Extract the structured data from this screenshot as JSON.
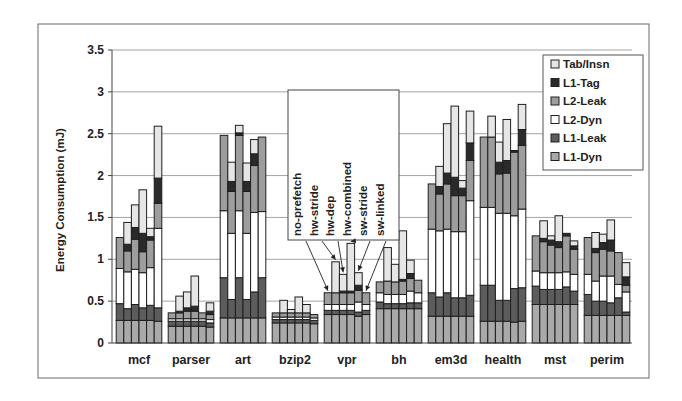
{
  "chart_data": {
    "type": "bar",
    "subtype": "grouped-stacked",
    "title": "",
    "xlabel": "",
    "ylabel": "Energy Consumption  (mJ)",
    "ylim": [
      0,
      3.5
    ],
    "yticks": [
      0,
      0.5,
      1,
      1.5,
      2,
      2.5,
      3,
      3.5
    ],
    "ytick_labels": [
      "0",
      "0.5",
      "1",
      "1.5",
      "2",
      "2.5",
      "3",
      "3.5"
    ],
    "grid": true,
    "legend_position": "top-right",
    "categories": [
      "mcf",
      "parser",
      "art",
      "bzip2",
      "vpr",
      "bh",
      "em3d",
      "health",
      "mst",
      "perim"
    ],
    "configurations": [
      "no-prefetch",
      "hw-stride",
      "hw-dep",
      "hw-combined",
      "sw-stride",
      "sw-linked"
    ],
    "annotation": {
      "labels": [
        "no-prefetch",
        "hw-stride",
        "hw-dep",
        "hw-combined",
        "sw-stride",
        "sw-linked"
      ],
      "points_to": "vpr"
    },
    "legend": [
      {
        "name": "Tab/Insn",
        "color": "#e6e6e6"
      },
      {
        "name": "L1-Tag",
        "color": "#2a2a2a"
      },
      {
        "name": "L2-Leak",
        "color": "#9d9d9d"
      },
      {
        "name": "L2-Dyn",
        "color": "#ffffff"
      },
      {
        "name": "L1-Leak",
        "color": "#5c5c5c"
      },
      {
        "name": "L1-Dyn",
        "color": "#a9a9a9"
      }
    ],
    "stack_order": [
      "L1-Dyn",
      "L1-Leak",
      "L2-Dyn",
      "L2-Leak",
      "L1-Tag",
      "Tab/Insn"
    ],
    "series_note": "Each benchmark has 6 bars (one per configuration); each bar stacks components in stack_order from bottom. Values in mJ.",
    "data": {
      "mcf": [
        {
          "L1-Dyn": 0.27,
          "L1-Leak": 0.2,
          "L2-Dyn": 0.42,
          "L2-Leak": 0.37,
          "L1-Tag": 0.0,
          "Tab/Insn": 0.0
        },
        {
          "L1-Dyn": 0.27,
          "L1-Leak": 0.14,
          "L2-Dyn": 0.44,
          "L2-Leak": 0.25,
          "L1-Tag": 0.08,
          "Tab/Insn": 0.26
        },
        {
          "L1-Dyn": 0.27,
          "L1-Leak": 0.19,
          "L2-Dyn": 0.42,
          "L2-Leak": 0.36,
          "L1-Tag": 0.14,
          "Tab/Insn": 0.27
        },
        {
          "L1-Dyn": 0.27,
          "L1-Leak": 0.15,
          "L2-Dyn": 0.42,
          "L2-Leak": 0.25,
          "L1-Tag": 0.22,
          "Tab/Insn": 0.52
        },
        {
          "L1-Dyn": 0.27,
          "L1-Leak": 0.18,
          "L2-Dyn": 0.45,
          "L2-Leak": 0.33,
          "L1-Tag": 0.04,
          "Tab/Insn": 0.1
        },
        {
          "L1-Dyn": 0.26,
          "L1-Leak": 0.16,
          "L2-Dyn": 0.95,
          "L2-Leak": 0.3,
          "L1-Tag": 0.3,
          "Tab/Insn": 0.62
        }
      ],
      "parser": [
        {
          "L1-Dyn": 0.2,
          "L1-Leak": 0.06,
          "L2-Dyn": 0.03,
          "L2-Leak": 0.07,
          "L1-Tag": 0.0,
          "Tab/Insn": 0.0
        },
        {
          "L1-Dyn": 0.2,
          "L1-Leak": 0.06,
          "L2-Dyn": 0.03,
          "L2-Leak": 0.07,
          "L1-Tag": 0.02,
          "Tab/Insn": 0.18
        },
        {
          "L1-Dyn": 0.2,
          "L1-Leak": 0.06,
          "L2-Dyn": 0.03,
          "L2-Leak": 0.09,
          "L1-Tag": 0.04,
          "Tab/Insn": 0.19
        },
        {
          "L1-Dyn": 0.2,
          "L1-Leak": 0.06,
          "L2-Dyn": 0.03,
          "L2-Leak": 0.09,
          "L1-Tag": 0.06,
          "Tab/Insn": 0.36
        },
        {
          "L1-Dyn": 0.2,
          "L1-Leak": 0.06,
          "L2-Dyn": 0.03,
          "L2-Leak": 0.07,
          "L1-Tag": 0.0,
          "Tab/Insn": 0.0
        },
        {
          "L1-Dyn": 0.19,
          "L1-Leak": 0.05,
          "L2-Dyn": 0.04,
          "L2-Leak": 0.06,
          "L1-Tag": 0.04,
          "Tab/Insn": 0.1
        }
      ],
      "art": [
        {
          "L1-Dyn": 0.3,
          "L1-Leak": 0.48,
          "L2-Dyn": 0.8,
          "L2-Leak": 0.9,
          "L1-Tag": 0.0,
          "Tab/Insn": 0.0
        },
        {
          "L1-Dyn": 0.3,
          "L1-Leak": 0.22,
          "L2-Dyn": 0.79,
          "L2-Leak": 0.5,
          "L1-Tag": 0.12,
          "Tab/Insn": 0.23
        },
        {
          "L1-Dyn": 0.3,
          "L1-Leak": 0.48,
          "L2-Dyn": 0.8,
          "L2-Leak": 0.9,
          "L1-Tag": 0.03,
          "Tab/Insn": 0.09
        },
        {
          "L1-Dyn": 0.3,
          "L1-Leak": 0.22,
          "L2-Dyn": 0.79,
          "L2-Leak": 0.5,
          "L1-Tag": 0.12,
          "Tab/Insn": 0.22
        },
        {
          "L1-Dyn": 0.3,
          "L1-Leak": 0.31,
          "L2-Dyn": 0.95,
          "L2-Leak": 0.56,
          "L1-Tag": 0.14,
          "Tab/Insn": 0.17
        },
        {
          "L1-Dyn": 0.3,
          "L1-Leak": 0.48,
          "L2-Dyn": 0.79,
          "L2-Leak": 0.89,
          "L1-Tag": 0.0,
          "Tab/Insn": 0.0
        }
      ],
      "bzip2": [
        {
          "L1-Dyn": 0.24,
          "L1-Leak": 0.04,
          "L2-Dyn": 0.03,
          "L2-Leak": 0.05,
          "L1-Tag": 0.0,
          "Tab/Insn": 0.0
        },
        {
          "L1-Dyn": 0.24,
          "L1-Leak": 0.04,
          "L2-Dyn": 0.03,
          "L2-Leak": 0.05,
          "L1-Tag": 0.0,
          "Tab/Insn": 0.15
        },
        {
          "L1-Dyn": 0.24,
          "L1-Leak": 0.04,
          "L2-Dyn": 0.03,
          "L2-Leak": 0.05,
          "L1-Tag": 0.0,
          "Tab/Insn": 0.04
        },
        {
          "L1-Dyn": 0.24,
          "L1-Leak": 0.04,
          "L2-Dyn": 0.03,
          "L2-Leak": 0.05,
          "L1-Tag": 0.0,
          "Tab/Insn": 0.19
        },
        {
          "L1-Dyn": 0.24,
          "L1-Leak": 0.04,
          "L2-Dyn": 0.03,
          "L2-Leak": 0.05,
          "L1-Tag": 0.0,
          "Tab/Insn": 0.1
        },
        {
          "L1-Dyn": 0.23,
          "L1-Leak": 0.04,
          "L2-Dyn": 0.03,
          "L2-Leak": 0.04,
          "L1-Tag": 0.0,
          "Tab/Insn": 0.0
        }
      ],
      "vpr": [
        {
          "L1-Dyn": 0.34,
          "L1-Leak": 0.05,
          "L2-Dyn": 0.07,
          "L2-Leak": 0.14,
          "L1-Tag": 0.0,
          "Tab/Insn": 0.0
        },
        {
          "L1-Dyn": 0.34,
          "L1-Leak": 0.05,
          "L2-Dyn": 0.07,
          "L2-Leak": 0.14,
          "L1-Tag": 0.0,
          "Tab/Insn": 0.37
        },
        {
          "L1-Dyn": 0.34,
          "L1-Leak": 0.05,
          "L2-Dyn": 0.07,
          "L2-Leak": 0.14,
          "L1-Tag": 0.02,
          "Tab/Insn": 0.2
        },
        {
          "L1-Dyn": 0.34,
          "L1-Leak": 0.05,
          "L2-Dyn": 0.07,
          "L2-Leak": 0.14,
          "L1-Tag": 0.02,
          "Tab/Insn": 0.57
        },
        {
          "L1-Dyn": 0.32,
          "L1-Leak": 0.05,
          "L2-Dyn": 0.12,
          "L2-Leak": 0.14,
          "L1-Tag": 0.06,
          "Tab/Insn": 0.15
        },
        {
          "L1-Dyn": 0.34,
          "L1-Leak": 0.05,
          "L2-Dyn": 0.07,
          "L2-Leak": 0.14,
          "L1-Tag": 0.0,
          "Tab/Insn": 0.0
        }
      ],
      "bh": [
        {
          "L1-Dyn": 0.41,
          "L1-Leak": 0.08,
          "L2-Dyn": 0.11,
          "L2-Leak": 0.13,
          "L1-Tag": 0.0,
          "Tab/Insn": 0.0
        },
        {
          "L1-Dyn": 0.41,
          "L1-Leak": 0.06,
          "L2-Dyn": 0.11,
          "L2-Leak": 0.16,
          "L1-Tag": 0.0,
          "Tab/Insn": 0.4
        },
        {
          "L1-Dyn": 0.41,
          "L1-Leak": 0.06,
          "L2-Dyn": 0.11,
          "L2-Leak": 0.15,
          "L1-Tag": 0.0,
          "Tab/Insn": 0.21
        },
        {
          "L1-Dyn": 0.41,
          "L1-Leak": 0.06,
          "L2-Dyn": 0.11,
          "L2-Leak": 0.16,
          "L1-Tag": 0.02,
          "Tab/Insn": 0.58
        },
        {
          "L1-Dyn": 0.41,
          "L1-Leak": 0.07,
          "L2-Dyn": 0.14,
          "L2-Leak": 0.15,
          "L1-Tag": 0.06,
          "Tab/Insn": 0.16
        },
        {
          "L1-Dyn": 0.41,
          "L1-Leak": 0.07,
          "L2-Dyn": 0.12,
          "L2-Leak": 0.15,
          "L1-Tag": 0.0,
          "Tab/Insn": 0.0
        }
      ],
      "em3d": [
        {
          "L1-Dyn": 0.32,
          "L1-Leak": 0.28,
          "L2-Dyn": 0.76,
          "L2-Leak": 0.54,
          "L1-Tag": 0.0,
          "Tab/Insn": 0.0
        },
        {
          "L1-Dyn": 0.32,
          "L1-Leak": 0.23,
          "L2-Dyn": 0.79,
          "L2-Leak": 0.44,
          "L1-Tag": 0.09,
          "Tab/Insn": 0.24
        },
        {
          "L1-Dyn": 0.32,
          "L1-Leak": 0.28,
          "L2-Dyn": 0.76,
          "L2-Leak": 0.54,
          "L1-Tag": 0.13,
          "Tab/Insn": 0.59
        },
        {
          "L1-Dyn": 0.32,
          "L1-Leak": 0.22,
          "L2-Dyn": 0.79,
          "L2-Leak": 0.43,
          "L1-Tag": 0.22,
          "Tab/Insn": 0.85
        },
        {
          "L1-Dyn": 0.32,
          "L1-Leak": 0.22,
          "L2-Dyn": 0.79,
          "L2-Leak": 0.43,
          "L1-Tag": 0.09,
          "Tab/Insn": 0.09
        },
        {
          "L1-Dyn": 0.32,
          "L1-Leak": 0.25,
          "L2-Dyn": 1.13,
          "L2-Leak": 0.48,
          "L1-Tag": 0.21,
          "Tab/Insn": 0.38
        }
      ],
      "health": [
        {
          "L1-Dyn": 0.26,
          "L1-Leak": 0.43,
          "L2-Dyn": 0.93,
          "L2-Leak": 0.84,
          "L1-Tag": 0.0,
          "Tab/Insn": 0.0
        },
        {
          "L1-Dyn": 0.26,
          "L1-Leak": 0.43,
          "L2-Dyn": 0.93,
          "L2-Leak": 0.84,
          "L1-Tag": 0.0,
          "Tab/Insn": 0.25
        },
        {
          "L1-Dyn": 0.26,
          "L1-Leak": 0.25,
          "L2-Dyn": 1.04,
          "L2-Leak": 0.47,
          "L1-Tag": 0.14,
          "Tab/Insn": 0.24
        },
        {
          "L1-Dyn": 0.26,
          "L1-Leak": 0.25,
          "L2-Dyn": 1.04,
          "L2-Leak": 0.48,
          "L1-Tag": 0.15,
          "Tab/Insn": 0.49
        },
        {
          "L1-Dyn": 0.25,
          "L1-Leak": 0.4,
          "L2-Dyn": 0.87,
          "L2-Leak": 0.76,
          "L1-Tag": 0.02,
          "Tab/Insn": 0.0
        },
        {
          "L1-Dyn": 0.26,
          "L1-Leak": 0.4,
          "L2-Dyn": 0.94,
          "L2-Leak": 0.76,
          "L1-Tag": 0.19,
          "Tab/Insn": 0.3
        }
      ],
      "mst": [
        {
          "L1-Dyn": 0.46,
          "L1-Leak": 0.22,
          "L2-Dyn": 0.18,
          "L2-Leak": 0.42,
          "L1-Tag": 0.0,
          "Tab/Insn": 0.0
        },
        {
          "L1-Dyn": 0.46,
          "L1-Leak": 0.18,
          "L2-Dyn": 0.2,
          "L2-Leak": 0.37,
          "L1-Tag": 0.04,
          "Tab/Insn": 0.21
        },
        {
          "L1-Dyn": 0.46,
          "L1-Leak": 0.18,
          "L2-Dyn": 0.2,
          "L2-Leak": 0.33,
          "L1-Tag": 0.06,
          "Tab/Insn": 0.05
        },
        {
          "L1-Dyn": 0.46,
          "L1-Leak": 0.18,
          "L2-Dyn": 0.2,
          "L2-Leak": 0.3,
          "L1-Tag": 0.07,
          "Tab/Insn": 0.31
        },
        {
          "L1-Dyn": 0.46,
          "L1-Leak": 0.21,
          "L2-Dyn": 0.18,
          "L2-Leak": 0.43,
          "L1-Tag": 0.03,
          "Tab/Insn": 0.0
        },
        {
          "L1-Dyn": 0.46,
          "L1-Leak": 0.16,
          "L2-Dyn": 0.2,
          "L2-Leak": 0.3,
          "L1-Tag": 0.04,
          "Tab/Insn": 0.06
        }
      ],
      "perim": [
        {
          "L1-Dyn": 0.33,
          "L1-Leak": 0.25,
          "L2-Dyn": 0.24,
          "L2-Leak": 0.44,
          "L1-Tag": 0.0,
          "Tab/Insn": 0.0
        },
        {
          "L1-Dyn": 0.33,
          "L1-Leak": 0.17,
          "L2-Dyn": 0.24,
          "L2-Leak": 0.34,
          "L1-Tag": 0.05,
          "Tab/Insn": 0.19
        },
        {
          "L1-Dyn": 0.33,
          "L1-Leak": 0.17,
          "L2-Dyn": 0.3,
          "L2-Leak": 0.32,
          "L1-Tag": 0.08,
          "Tab/Insn": 0.1
        },
        {
          "L1-Dyn": 0.33,
          "L1-Leak": 0.15,
          "L2-Dyn": 0.32,
          "L2-Leak": 0.3,
          "L1-Tag": 0.13,
          "Tab/Insn": 0.24
        },
        {
          "L1-Dyn": 0.33,
          "L1-Leak": 0.21,
          "L2-Dyn": 0.16,
          "L2-Leak": 0.38,
          "L1-Tag": 0.0,
          "Tab/Insn": 0.0
        },
        {
          "L1-Dyn": 0.33,
          "L1-Leak": 0.04,
          "L2-Dyn": 0.24,
          "L2-Leak": 0.08,
          "L1-Tag": 0.1,
          "Tab/Insn": 0.17
        }
      ]
    }
  }
}
